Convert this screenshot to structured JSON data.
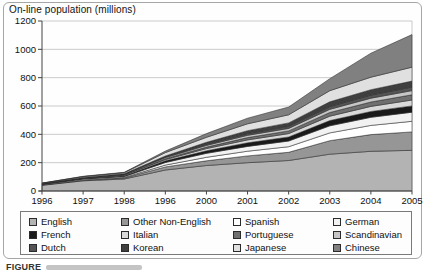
{
  "figure": {
    "title": "On-line population (millions)",
    "caption_partial": "FIGURE"
  },
  "chart_data": {
    "type": "area",
    "stacked": true,
    "title": "On-line population (millions)",
    "xlabel": "",
    "ylabel": "On-line population (millions)",
    "ylim": [
      0,
      1200
    ],
    "ytick_interval": 200,
    "grid": true,
    "legend_position": "bottom",
    "x_tick_labels": [
      "1996",
      "1997",
      "1998",
      "1996",
      "2000",
      "2001",
      "2002",
      "2003",
      "2004",
      "2005"
    ],
    "note": "values estimated from gridlines; 4th x label is printed as 1996 in the source figure",
    "y_tick_labels": [
      "0",
      "200",
      "400",
      "600",
      "800",
      "1000",
      "1200"
    ],
    "series": [
      {
        "name": "English",
        "color": "#b3b3b3",
        "values": [
          40,
          72,
          85,
          148,
          180,
          200,
          215,
          260,
          280,
          287
        ]
      },
      {
        "name": "Other Non-English",
        "color": "#969696",
        "values": [
          3,
          4,
          6,
          22,
          33,
          48,
          58,
          95,
          118,
          130
        ]
      },
      {
        "name": "Spanish",
        "color": "#ffffff",
        "values": [
          1,
          2,
          4,
          13,
          25,
          33,
          40,
          55,
          65,
          75
        ]
      },
      {
        "name": "German",
        "color": "#f2f2f2",
        "values": [
          3,
          6,
          7,
          18,
          28,
          34,
          40,
          50,
          57,
          64
        ]
      },
      {
        "name": "French",
        "color": "#1a1a1a",
        "values": [
          2,
          4,
          6,
          12,
          18,
          25,
          28,
          37,
          41,
          45
        ]
      },
      {
        "name": "Italian",
        "color": "#d9d9d9",
        "values": [
          1,
          2,
          4,
          9,
          15,
          21,
          24,
          31,
          36,
          41
        ]
      },
      {
        "name": "Portuguese",
        "color": "#707070",
        "values": [
          1,
          1,
          2,
          6,
          11,
          16,
          19,
          26,
          31,
          37
        ]
      },
      {
        "name": "Scandinavian",
        "color": "#c6c6c6",
        "values": [
          1,
          3,
          4,
          8,
          12,
          16,
          18,
          23,
          27,
          30
        ]
      },
      {
        "name": "Dutch",
        "color": "#545454",
        "values": [
          1,
          1,
          2,
          5,
          9,
          12,
          14,
          19,
          22,
          25
        ]
      },
      {
        "name": "Korean",
        "color": "#3f3f3f",
        "values": [
          0,
          1,
          2,
          6,
          13,
          21,
          25,
          34,
          38,
          42
        ]
      },
      {
        "name": "Japanese",
        "color": "#e0e0e0",
        "values": [
          2,
          6,
          7,
          24,
          35,
          48,
          57,
          78,
          88,
          98
        ]
      },
      {
        "name": "Chinese",
        "color": "#808080",
        "values": [
          1,
          2,
          3,
          11,
          26,
          40,
          55,
          85,
          170,
          230
        ]
      }
    ]
  }
}
